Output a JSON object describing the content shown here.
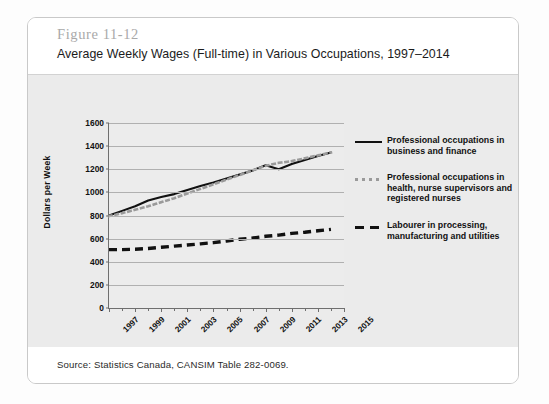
{
  "card": {
    "figure_label": "Figure 11-12",
    "title": "Average Weekly Wages (Full-time) in Various Occupations, 1997–2014",
    "source": "Source: Statistics Canada, CANSIM Table 282-0069."
  },
  "legend": {
    "items": [
      {
        "style": "solid",
        "label": "Professional occupations in business and finance"
      },
      {
        "style": "dotted",
        "label": "Professional occupations in health, nurse supervisors and registered nurses"
      },
      {
        "style": "dashed",
        "label": "Labourer in processing, manufacturing and utilities"
      }
    ]
  },
  "chart_data": {
    "type": "line",
    "title": "Average Weekly Wages (Full-time) in Various Occupations, 1997–2014",
    "xlabel": "",
    "ylabel": "Dollars per Week",
    "ylim": [
      0,
      1600
    ],
    "yticks": [
      0,
      200,
      400,
      600,
      800,
      1000,
      1200,
      1400,
      1600
    ],
    "xlim": [
      1997,
      2015
    ],
    "xticks": [
      1997,
      1999,
      2001,
      2003,
      2005,
      2007,
      2009,
      2011,
      2013,
      2015
    ],
    "minor_xticks": [
      1998,
      2000,
      2002,
      2004,
      2006,
      2008,
      2010,
      2012,
      2014
    ],
    "grid": "horizontal",
    "legend_position": "right",
    "x": [
      1997,
      1998,
      1999,
      2000,
      2001,
      2002,
      2003,
      2004,
      2005,
      2006,
      2007,
      2008,
      2009,
      2010,
      2011,
      2012,
      2013,
      2014
    ],
    "series": [
      {
        "name": "Professional occupations in business and finance",
        "style": "solid",
        "color": "#111111",
        "values": [
          800,
          840,
          880,
          930,
          960,
          985,
          1020,
          1055,
          1085,
          1120,
          1155,
          1190,
          1235,
          1200,
          1245,
          1280,
          1315,
          1345
        ]
      },
      {
        "name": "Professional occupations in health, nurse supervisors and registered nurses",
        "style": "dotted",
        "color": "#9a9a9a",
        "values": [
          795,
          820,
          850,
          880,
          915,
          950,
          990,
          1030,
          1070,
          1110,
          1150,
          1190,
          1230,
          1255,
          1270,
          1295,
          1320,
          1345
        ]
      },
      {
        "name": "Labourer in processing, manufacturing and utilities",
        "style": "dashed",
        "color": "#111111",
        "values": [
          505,
          505,
          508,
          515,
          525,
          535,
          545,
          555,
          565,
          580,
          595,
          605,
          620,
          630,
          645,
          655,
          668,
          680
        ]
      }
    ]
  }
}
